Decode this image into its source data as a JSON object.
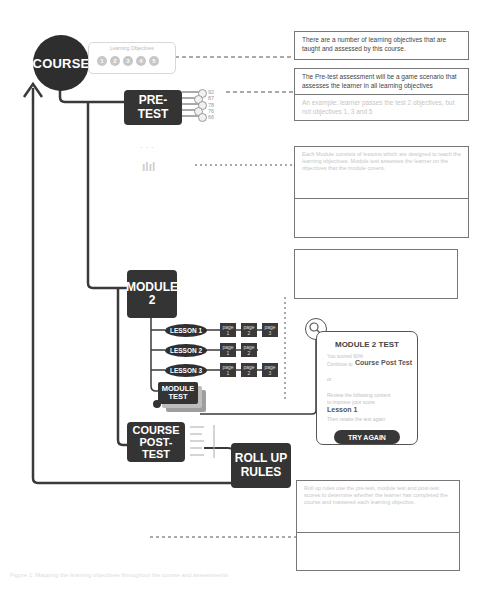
{
  "nodes": {
    "course": "COURSE",
    "pretest": "PRE-TEST",
    "module": "MODULE 2",
    "module_test": "MODULE TEST",
    "course_post_test": "COURSE POST-TEST",
    "roll_up_rules": "ROLL UP RULES"
  },
  "objectives": {
    "label": "Learning Objectives",
    "items": [
      "1",
      "2",
      "3",
      "4",
      "5"
    ]
  },
  "pretest_scores": [
    "92",
    "87",
    "78",
    "76",
    "66"
  ],
  "lessons": [
    {
      "label": "LESSON 1",
      "pages": [
        "page 1",
        "page 2",
        "page 3"
      ]
    },
    {
      "label": "LESSON 2",
      "pages": [
        "page 1",
        "page 2"
      ]
    },
    {
      "label": "LESSON 3",
      "pages": [
        "page 1",
        "page 2",
        "page 3"
      ]
    }
  ],
  "notes": {
    "n1": "There are a number of learning objectives that are taught and assessed by this course.",
    "n2_main": "The Pre-test assessment will be a game scenario that assesses the learner in all learning objectives",
    "n2_sub": "An example: learner passes the test 2 objectives, but not objectives 1, 3 and 5",
    "n3": "Each Module consists of lessons which are designed to teach the learning objectives. Module test assesses the learner on the objectives that the module covers.",
    "n5": "Roll up rules use the pre-test, module test and post-test scores to determine whether the learner has completed the course and mastered each learning objective."
  },
  "module_test_card": {
    "title": "MODULE 2 TEST",
    "line1": "You scored 60%",
    "line2_prefix": "Continue to",
    "line2_strong": "Course Post Test",
    "line3": "or",
    "line4": "Review the following content",
    "line5": "to improve your score",
    "lesson_link": "Lesson 1",
    "line6": "Then retake the test again",
    "button": "TRY AGAIN"
  },
  "caption": "Figure 1: Mapping the learning objectives throughout the course and assessments"
}
